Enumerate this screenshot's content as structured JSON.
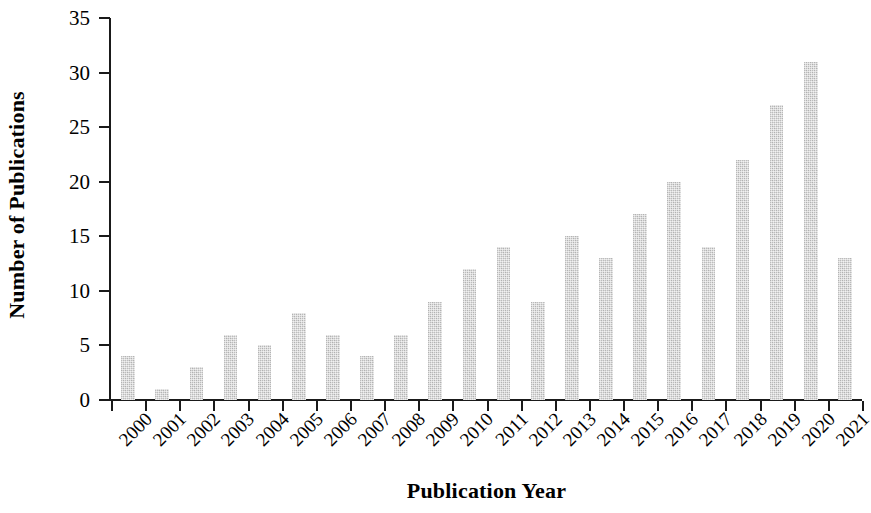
{
  "chart_data": {
    "type": "bar",
    "title": "",
    "xlabel": "Publication Year",
    "ylabel": "Number of Publications",
    "categories": [
      "2000",
      "2001",
      "2002",
      "2003",
      "2004",
      "2005",
      "2006",
      "2007",
      "2008",
      "2009",
      "2010",
      "2011",
      "2012",
      "2013",
      "2014",
      "2015",
      "2016",
      "2017",
      "2018",
      "2019",
      "2020",
      "2021"
    ],
    "values": [
      4,
      1,
      3,
      6,
      5,
      8,
      6,
      4,
      6,
      9,
      12,
      14,
      9,
      15,
      13,
      17,
      20,
      14,
      22,
      27,
      31,
      13
    ],
    "ylim": [
      0,
      35
    ],
    "y_ticks": [
      0,
      5,
      10,
      15,
      20,
      25,
      30,
      35
    ],
    "y_tick_labels": [
      "0",
      "5",
      "10",
      "15",
      "20",
      "25",
      "30",
      "35"
    ],
    "grid": false,
    "legend": "none",
    "bar_color": "#d2d2d2",
    "axis_color": "#1a1a1a",
    "x_tick_rotation": -45
  }
}
